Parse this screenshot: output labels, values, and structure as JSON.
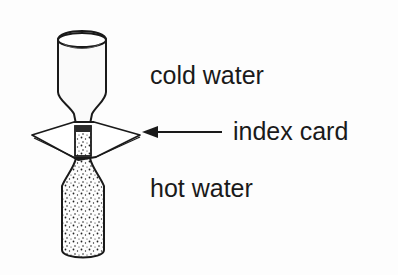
{
  "diagram": {
    "labels": {
      "cold_water": "cold water",
      "index_card": "index card",
      "hot_water": "hot water"
    },
    "parts": [
      {
        "name": "top-bottle",
        "content": "cold water",
        "fill": "clear"
      },
      {
        "name": "index-card",
        "orientation": "horizontal between bottle mouths"
      },
      {
        "name": "bottom-bottle",
        "content": "hot water",
        "fill": "stippled"
      }
    ],
    "colors": {
      "ink": "#1a1a1a",
      "background": "#fdfdfd"
    }
  }
}
